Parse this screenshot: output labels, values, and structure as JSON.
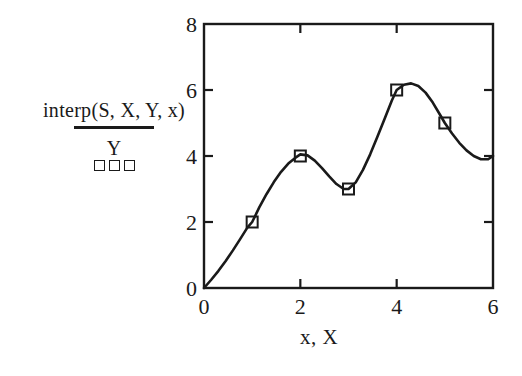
{
  "figure": {
    "background_color": "#ffffff",
    "ink_color": "#1a1a1a"
  },
  "legend": {
    "series_line_label": "interp(S, X, Y, x)",
    "series_marker_label": "Y",
    "marker_glyphs": [
      "square",
      "square",
      "square"
    ]
  },
  "axes": {
    "x_title": "x, X",
    "y_title": "",
    "x_ticks": [
      "0",
      "2",
      "4",
      "6"
    ],
    "y_ticks": [
      "0",
      "2",
      "4",
      "6",
      "8"
    ]
  },
  "chart_data": {
    "type": "line",
    "title": "",
    "xlabel": "x, X",
    "ylabel": "",
    "xlim": [
      0,
      6
    ],
    "ylim": [
      0,
      8
    ],
    "xticks": [
      0,
      2,
      4,
      6
    ],
    "yticks": [
      0,
      2,
      4,
      6,
      8
    ],
    "grid": false,
    "legend_position": "left-outside",
    "series": [
      {
        "name": "interp(S, X, Y, x)",
        "style": "solid-line",
        "marker": "none",
        "color": "#1a1a1a",
        "x": [
          0.0,
          0.15,
          0.3,
          0.45,
          0.6,
          0.75,
          0.9,
          1.0,
          1.15,
          1.3,
          1.45,
          1.6,
          1.75,
          1.9,
          2.0,
          2.15,
          2.3,
          2.45,
          2.6,
          2.75,
          2.9,
          3.0,
          3.15,
          3.3,
          3.45,
          3.6,
          3.75,
          3.9,
          4.0,
          4.15,
          4.3,
          4.45,
          4.6,
          4.75,
          4.9,
          5.0,
          5.15,
          5.3,
          5.45,
          5.6,
          5.75,
          5.9,
          6.0
        ],
        "y": [
          0.0,
          0.25,
          0.52,
          0.82,
          1.14,
          1.48,
          1.83,
          2.0,
          2.45,
          2.85,
          3.21,
          3.52,
          3.77,
          3.95,
          4.05,
          4.02,
          3.86,
          3.63,
          3.38,
          3.15,
          3.0,
          3.0,
          3.2,
          3.58,
          4.05,
          4.58,
          5.13,
          5.68,
          6.0,
          6.16,
          6.2,
          6.12,
          5.92,
          5.62,
          5.25,
          5.0,
          4.68,
          4.4,
          4.17,
          4.0,
          3.9,
          3.9,
          4.0
        ]
      },
      {
        "name": "Y",
        "style": "markers",
        "marker": "open-square",
        "color": "#1a1a1a",
        "x": [
          0,
          1,
          2,
          3,
          4,
          5
        ],
        "y": [
          0,
          2,
          4,
          3,
          6,
          5
        ]
      }
    ]
  }
}
